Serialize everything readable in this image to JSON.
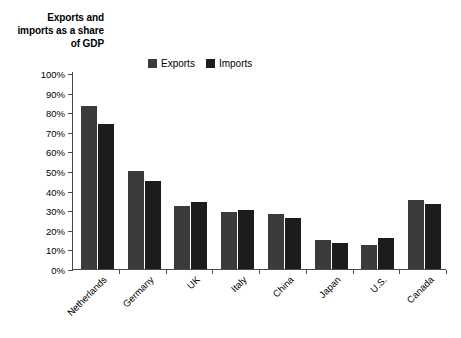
{
  "chart_data": {
    "type": "bar",
    "title": "Exports and imports as a share of GDP",
    "xlabel": "",
    "ylabel": "",
    "ylim": [
      0,
      100
    ],
    "ytick_labels": [
      "100%",
      "90%",
      "80%",
      "70%",
      "60%",
      "50%",
      "40%",
      "30%",
      "20%",
      "10%",
      "0%"
    ],
    "ytick_values": [
      100,
      90,
      80,
      70,
      60,
      50,
      40,
      30,
      20,
      10,
      0
    ],
    "grid": false,
    "legend_position": "top-center",
    "categories": [
      "Netherlands",
      "Germany",
      "UK",
      "Italy",
      "China",
      "Japan",
      "U.S.",
      "Canada"
    ],
    "series": [
      {
        "name": "Exports",
        "color": "#3b3b3b",
        "values": [
          83,
          50,
          32,
          29,
          28,
          15,
          12.5,
          35
        ]
      },
      {
        "name": "Imports",
        "color": "#1c1c1c",
        "values": [
          74,
          45,
          34,
          30,
          26,
          13.5,
          16,
          33
        ]
      }
    ]
  },
  "axis": {
    "line_color": "#4a4a4a"
  }
}
